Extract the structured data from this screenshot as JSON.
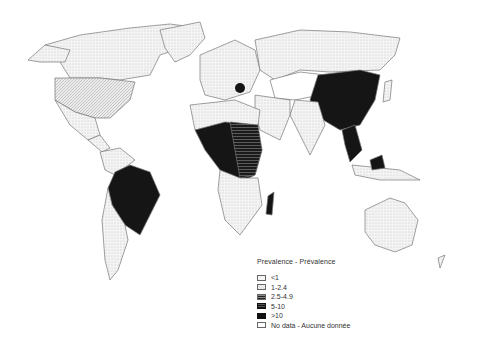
{
  "map": {
    "title": "World prevalence map",
    "colors": {
      "lt1": "#f2f2f2",
      "r1_2_4": "#dcdcdc",
      "r2_5_4_9": "#555555",
      "r5_10": "#333333",
      "gt10": "#151515",
      "no_data": "#ffffff",
      "border": "#777777"
    }
  },
  "legend": {
    "title": "Prevalence - Prévalence",
    "items": [
      {
        "label": "<1"
      },
      {
        "label": "1-2.4"
      },
      {
        "label": "2.5-4.9"
      },
      {
        "label": "5-10"
      },
      {
        "label": ">10"
      },
      {
        "label": "No data - Aucune donnée"
      }
    ]
  }
}
